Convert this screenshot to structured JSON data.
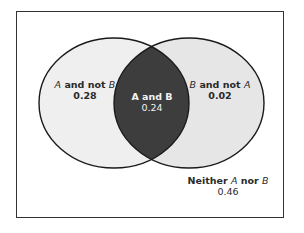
{
  "diagram": {
    "type": "venn",
    "sets": [
      "A",
      "B"
    ],
    "colors": {
      "background": "#ffffff",
      "circle_fill": "#ececec",
      "intersection_fill": "#3d3d3d",
      "stroke": "#1a1a1a"
    },
    "regions": {
      "a_not_b": {
        "label_prefix": "A",
        "label_mid": " and not ",
        "label_suffix": "B",
        "value": "0.28"
      },
      "a_and_b": {
        "label": "A and B",
        "value": "0.24"
      },
      "b_not_a": {
        "label_prefix": "B",
        "label_mid": " and not ",
        "label_suffix": "A",
        "value": "0.02"
      },
      "neither": {
        "label_prefix": "Neither ",
        "label_mid": "A",
        "label_mid2": " nor ",
        "label_suffix": "B",
        "value": "0.46"
      }
    }
  }
}
